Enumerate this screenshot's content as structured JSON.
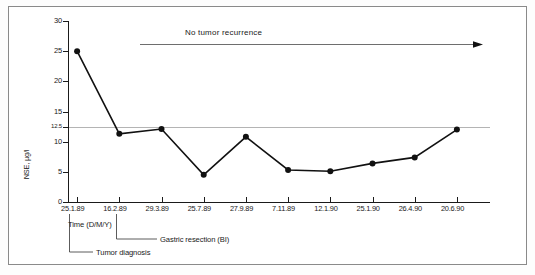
{
  "chart_data": {
    "type": "line",
    "title": "",
    "xlabel": "Time (D/M/Y)",
    "ylabel": "NSE, µg/l",
    "ylim": [
      0,
      30
    ],
    "grid": false,
    "legend": "none",
    "categories": [
      "25.1.89",
      "16.2.89",
      "29.3.89",
      "25.7.89",
      "27.9.89",
      "7.11.89",
      "12.1.90",
      "25.1.90",
      "26.4.90",
      "20.6.90"
    ],
    "values": [
      25.0,
      11.3,
      12.1,
      4.5,
      10.8,
      5.3,
      5.1,
      6.4,
      7.4,
      12.0
    ],
    "ytick_labels": [
      "30",
      "25",
      "20",
      "15",
      "12.5",
      "10",
      "5",
      "0"
    ],
    "ytick_values": [
      30,
      25,
      20,
      15,
      12.5,
      10,
      5,
      0
    ],
    "reference_line": {
      "value": 12.5,
      "label": "12.5",
      "color": "#b4b4b4"
    },
    "annotations": [
      {
        "name": "no-tumor-recurrence",
        "text": "No tumor recurrence"
      },
      {
        "name": "time-axis-caption",
        "text": "Time  (D/M/Y)"
      },
      {
        "name": "gastric-resection",
        "text": "Gastric resection (BI)"
      },
      {
        "name": "tumor-diagnosis",
        "text": "Tumor diagnosis"
      }
    ],
    "marker_color": "#111111",
    "line_color": "#111111"
  }
}
